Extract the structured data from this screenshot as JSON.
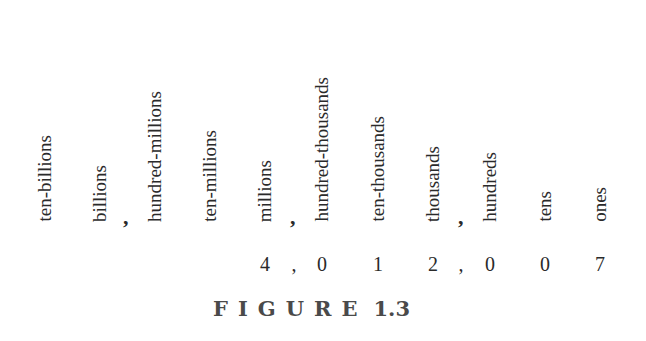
{
  "figure": {
    "place_values": [
      {
        "label": "ten-billions",
        "x": 45
      },
      {
        "label": "billions",
        "x": 100
      },
      {
        "label": "hundred-millions",
        "x": 155
      },
      {
        "label": "ten-millions",
        "x": 210
      },
      {
        "label": "millions",
        "x": 265
      },
      {
        "label": "hundred-thousands",
        "x": 322
      },
      {
        "label": "ten-thousands",
        "x": 378
      },
      {
        "label": "thousands",
        "x": 433
      },
      {
        "label": "hundreds",
        "x": 490
      },
      {
        "label": "tens",
        "x": 545
      },
      {
        "label": "ones",
        "x": 600
      }
    ],
    "group_separator": ",",
    "number": {
      "value": "4,012,007",
      "digits": [
        "4",
        "0",
        "1",
        "2",
        "0",
        "0",
        "7"
      ],
      "separator": ","
    },
    "caption": {
      "word": "FIGURE",
      "number": "1.3"
    }
  }
}
